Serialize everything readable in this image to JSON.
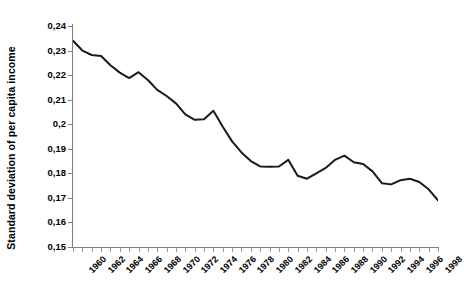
{
  "chart_data": {
    "type": "line",
    "title": "",
    "xlabel": "",
    "ylabel": "Standard deviation of per capita income",
    "ylim": [
      0.15,
      0.24
    ],
    "xlim": [
      1960,
      1999
    ],
    "grid": false,
    "legend": "none",
    "line_color": "#1a1a1a",
    "axis_color": "#808080",
    "decimal_separator": ",",
    "y_ticks": [
      "0,15",
      "0,16",
      "0,17",
      "0,18",
      "0,19",
      "0,2",
      "0,21",
      "0,22",
      "0,23",
      "0,24"
    ],
    "y_tick_values": [
      0.15,
      0.16,
      0.17,
      0.18,
      0.19,
      0.2,
      0.21,
      0.22,
      0.23,
      0.24
    ],
    "x_tick_labels": [
      "1960",
      "1962",
      "1964",
      "1966",
      "1968",
      "1970",
      "1972",
      "1974",
      "1976",
      "1978",
      "1980",
      "1982",
      "1984",
      "1986",
      "1988",
      "1990",
      "1992",
      "1994",
      "1996",
      "1998"
    ],
    "x_tick_label_rotation": -45,
    "x": [
      1960,
      1961,
      1962,
      1963,
      1964,
      1965,
      1966,
      1967,
      1968,
      1969,
      1970,
      1971,
      1972,
      1973,
      1974,
      1975,
      1976,
      1977,
      1978,
      1979,
      1980,
      1981,
      1982,
      1983,
      1984,
      1985,
      1986,
      1987,
      1988,
      1989,
      1990,
      1991,
      1992,
      1993,
      1994,
      1995,
      1996,
      1997,
      1998,
      1999
    ],
    "values": [
      0.234,
      0.23,
      0.2282,
      0.2278,
      0.224,
      0.221,
      0.2188,
      0.2212,
      0.218,
      0.214,
      0.2115,
      0.2085,
      0.204,
      0.2018,
      0.202,
      0.2055,
      0.199,
      0.193,
      0.1885,
      0.185,
      0.1828,
      0.1827,
      0.1828,
      0.1855,
      0.179,
      0.1778,
      0.18,
      0.1822,
      0.1855,
      0.1872,
      0.1845,
      0.1838,
      0.1808,
      0.176,
      0.1755,
      0.1772,
      0.1778,
      0.1765,
      0.1735,
      0.169
    ],
    "series": [
      {
        "name": "Standard deviation of per capita income",
        "values": [
          0.234,
          0.23,
          0.2282,
          0.2278,
          0.224,
          0.221,
          0.2188,
          0.2212,
          0.218,
          0.214,
          0.2115,
          0.2085,
          0.204,
          0.2018,
          0.202,
          0.2055,
          0.199,
          0.193,
          0.1885,
          0.185,
          0.1828,
          0.1827,
          0.1828,
          0.1855,
          0.179,
          0.1778,
          0.18,
          0.1822,
          0.1855,
          0.1872,
          0.1845,
          0.1838,
          0.1808,
          0.176,
          0.1755,
          0.1772,
          0.1778,
          0.1765,
          0.1735,
          0.169
        ]
      }
    ]
  }
}
